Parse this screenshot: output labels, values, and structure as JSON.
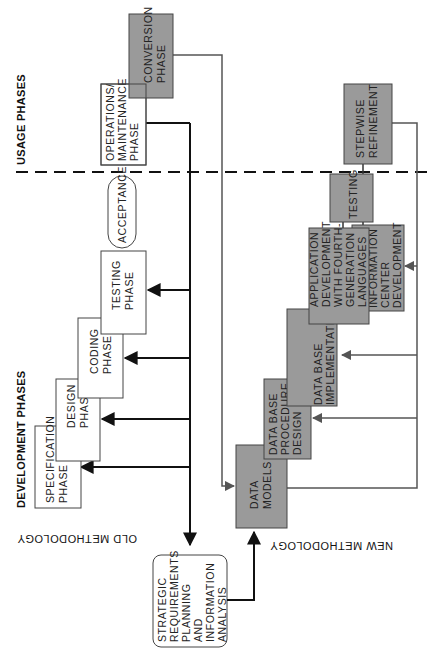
{
  "section_labels": {
    "usage_phases": "USAGE PHASES",
    "development_phases": "DEVELOPMENT PHASES",
    "old_methodology": "OLD METHODOLOGY",
    "new_methodology": "NEW METHODOLOGY"
  },
  "old_methodology": {
    "boxes": [
      {
        "id": "specification",
        "lines": [
          "SPECIFICATION",
          "PHASE"
        ]
      },
      {
        "id": "design",
        "lines": [
          "DESIGN",
          "PHASE"
        ]
      },
      {
        "id": "coding",
        "lines": [
          "CODING",
          "PHASE"
        ]
      },
      {
        "id": "testing",
        "lines": [
          "TESTING",
          "PHASE"
        ]
      },
      {
        "id": "acceptance",
        "lines": [
          "ACCEPTANCE"
        ]
      },
      {
        "id": "operations",
        "lines": [
          "OPERATIONS/",
          "MAINTENANCE",
          "PHASE"
        ]
      }
    ]
  },
  "new_methodology": {
    "boxes": [
      {
        "id": "data-models",
        "lines": [
          "DATA",
          "MODELS"
        ]
      },
      {
        "id": "db-procedure-design",
        "lines": [
          "DATA BASE",
          "PROCEDURE",
          "DESIGN"
        ]
      },
      {
        "id": "db-implementation",
        "lines": [
          "DATA BASE",
          "IMPLEMENTATION"
        ]
      },
      {
        "id": "app-development",
        "lines": [
          "APPLICATION",
          "DEVELOPMENT",
          "WITH FOURTH-",
          "GENERATION",
          "LANGUAGES"
        ]
      },
      {
        "id": "info-center",
        "lines": [
          "INFORMATION",
          "CENTER",
          "DEVELOPMENT"
        ]
      },
      {
        "id": "testing",
        "lines": [
          "TESTING"
        ]
      },
      {
        "id": "stepwise",
        "lines": [
          "STEPWISE",
          "REFINEMENT"
        ]
      },
      {
        "id": "conversion",
        "lines": [
          "CONVERSION",
          "PHASE"
        ]
      }
    ]
  },
  "shared": {
    "strategic": {
      "lines": [
        "STRATEGIC",
        "REQUIREMENTS",
        "PLANNING",
        "AND",
        "INFORMATION",
        "ANALYSIS"
      ]
    }
  },
  "colors": {
    "shaded_box": "#9a9a9a",
    "white_box": "#ffffff",
    "line_dark": "#111111",
    "line_gray": "#555555"
  }
}
